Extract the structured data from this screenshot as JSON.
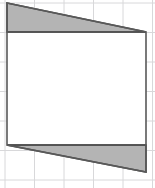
{
  "figure": {
    "canvas": {
      "width": 155,
      "height": 188
    },
    "background": {
      "paper_color": "#ffffff",
      "grid_color": "#d8d8da",
      "grid_line_width": 1,
      "grid_spacing_x": 29.5,
      "grid_spacing_y": 29.5,
      "grid_origin_x": 5,
      "grid_origin_y": 3,
      "grid_visible": true
    },
    "outline": {
      "stroke_color": "#595959",
      "stroke_width": 1.6,
      "fill_color": "#ffffff",
      "label": "quadrilateral-outline",
      "vertices": [
        {
          "name": "top-left",
          "x": 7,
          "y": 3
        },
        {
          "name": "top-right",
          "x": 146,
          "y": 32
        },
        {
          "name": "bottom-right",
          "x": 146,
          "y": 172
        },
        {
          "name": "bottom-left",
          "x": 7,
          "y": 145
        }
      ]
    },
    "shaded_regions": [
      {
        "name": "upper-shaded-triangle",
        "fill_color": "#b4b4b4",
        "stroke_color": "#4d4d4d",
        "stroke_width": 1.6,
        "vertices": [
          {
            "x": 7,
            "y": 3
          },
          {
            "x": 146,
            "y": 32
          },
          {
            "x": 7,
            "y": 32
          }
        ]
      },
      {
        "name": "lower-shaded-triangle",
        "fill_color": "#b4b4b4",
        "stroke_color": "#4d4d4d",
        "stroke_width": 1.6,
        "vertices": [
          {
            "x": 7,
            "y": 145
          },
          {
            "x": 146,
            "y": 145
          },
          {
            "x": 146,
            "y": 172
          }
        ]
      }
    ],
    "divider_lines": [
      {
        "name": "upper-horizontal-divider",
        "x1": 7,
        "y1": 32,
        "x2": 146,
        "y2": 32,
        "stroke_color": "#4d4d4d",
        "stroke_width": 1.6
      },
      {
        "name": "lower-horizontal-divider",
        "x1": 7,
        "y1": 145,
        "x2": 146,
        "y2": 145,
        "stroke_color": "#4d4d4d",
        "stroke_width": 1.6
      }
    ],
    "interior_region": {
      "name": "unshaded-interior-rectangle",
      "fill_color": "#ffffff",
      "vertices": [
        {
          "x": 7,
          "y": 32
        },
        {
          "x": 146,
          "y": 32
        },
        {
          "x": 146,
          "y": 145
        },
        {
          "x": 7,
          "y": 145
        }
      ]
    }
  }
}
